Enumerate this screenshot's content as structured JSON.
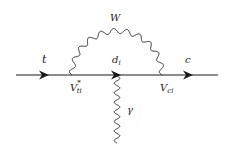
{
  "diagram": {
    "type": "feynman-diagram",
    "colors": {
      "line": "#1a1a1a",
      "background": "#ffffff"
    },
    "particles": {
      "incoming": {
        "symbol": "t"
      },
      "internal_fermion": {
        "symbol": "d",
        "subscript": "i"
      },
      "outgoing": {
        "symbol": "c"
      },
      "loop_boson": {
        "symbol": "W"
      },
      "emitted_boson": {
        "symbol": "γ"
      }
    },
    "vertices": {
      "left": {
        "symbol": "V",
        "subscript": "ti",
        "superscript": "*"
      },
      "right": {
        "symbol": "V",
        "subscript": "ci"
      }
    },
    "edges": [
      {
        "from": "in",
        "to": "left-vertex",
        "kind": "fermion",
        "label": "t"
      },
      {
        "from": "left-vertex",
        "to": "right-vertex",
        "kind": "fermion",
        "label": "d_i"
      },
      {
        "from": "right-vertex",
        "to": "out",
        "kind": "fermion",
        "label": "c"
      },
      {
        "from": "left-vertex",
        "to": "right-vertex",
        "kind": "wavy-arc",
        "label": "W"
      },
      {
        "from": "d_i-line",
        "to": "out-photon",
        "kind": "wavy",
        "label": "γ"
      }
    ]
  }
}
